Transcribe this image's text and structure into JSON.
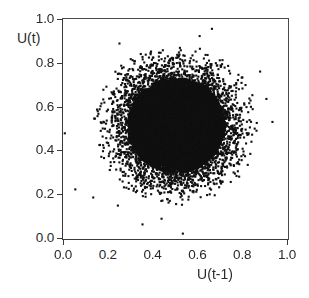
{
  "chart_data": {
    "type": "scatter",
    "title": "",
    "xlabel": "U(t-1)",
    "ylabel": "U(t)",
    "xlim": [
      0.0,
      1.0
    ],
    "ylim": [
      0.0,
      1.0
    ],
    "xticks": [
      "0.0",
      "0.2",
      "0.4",
      "0.6",
      "0.8",
      "1.0"
    ],
    "xtick_values": [
      0.0,
      0.2,
      0.4,
      0.6,
      0.8,
      1.0
    ],
    "yticks": [
      "0.0",
      "0.2",
      "0.4",
      "0.6",
      "0.8",
      "1.0"
    ],
    "ytick_values": [
      0.0,
      0.2,
      0.4,
      0.6,
      0.8,
      1.0
    ],
    "grid": false,
    "legend": null,
    "marker": {
      "shape": "square",
      "color": "#101010",
      "size_px": 2.1
    },
    "series": [
      {
        "name": "U(t) vs U(t-1) return map",
        "n_points": 8200,
        "distribution": "isotropic-gaussian-cloud",
        "center": [
          0.505,
          0.515
        ],
        "sigma": [
          0.125,
          0.125
        ],
        "radial_cutoff": 2.95,
        "core_saturated": true,
        "core_radius": 0.175,
        "observed_extent_x": [
          0.01,
          0.95
        ],
        "observed_extent_y": [
          0.02,
          0.96
        ]
      }
    ],
    "outliers": [
      {
        "x": 0.008,
        "y": 0.478
      },
      {
        "x": 0.055,
        "y": 0.222
      },
      {
        "x": 0.135,
        "y": 0.185
      },
      {
        "x": 0.245,
        "y": 0.148
      },
      {
        "x": 0.355,
        "y": 0.062
      },
      {
        "x": 0.44,
        "y": 0.088
      },
      {
        "x": 0.535,
        "y": 0.02
      },
      {
        "x": 0.665,
        "y": 0.955
      },
      {
        "x": 0.61,
        "y": 0.922
      },
      {
        "x": 0.252,
        "y": 0.888
      },
      {
        "x": 0.935,
        "y": 0.53
      },
      {
        "x": 0.908,
        "y": 0.635
      },
      {
        "x": 0.88,
        "y": 0.76
      }
    ]
  }
}
